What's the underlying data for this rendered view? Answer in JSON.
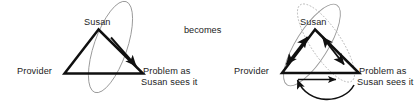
{
  "figure": {
    "type": "diagram",
    "connector_label": "becomes",
    "panels": [
      {
        "id": "before",
        "nodes": [
          {
            "id": "susan",
            "label": "Susan"
          },
          {
            "id": "provider",
            "label": "Provider"
          },
          {
            "id": "problem",
            "label_line1": "Problem as",
            "label_line2": "Susan sees it"
          }
        ],
        "arrows": [
          {
            "from": "susan",
            "to": "problem",
            "style": "straight",
            "heads": "single"
          }
        ],
        "ellipses": [
          {
            "id": "susan-problem-ellipse",
            "style": "solid",
            "color": "#9a9a9a",
            "encloses": [
              "susan",
              "problem"
            ]
          }
        ]
      },
      {
        "id": "after",
        "nodes": [
          {
            "id": "susan",
            "label": "Susan"
          },
          {
            "id": "provider",
            "label": "Provider"
          },
          {
            "id": "problem",
            "label_line1": "Problem as",
            "label_line2": "Susan sees it"
          }
        ],
        "arrows": [
          {
            "from": "provider",
            "to": "susan",
            "style": "straight",
            "heads": "double"
          },
          {
            "from": "susan",
            "to": "problem",
            "style": "straight",
            "heads": "double"
          },
          {
            "from": "provider",
            "to": "problem",
            "style": "straight",
            "heads": "single"
          },
          {
            "from": "problem",
            "to": "provider",
            "style": "curved",
            "heads": "single"
          }
        ],
        "ellipses": [
          {
            "id": "susan-provider-ellipse",
            "style": "solid",
            "color": "#9a9a9a",
            "encloses": [
              "susan",
              "provider"
            ]
          },
          {
            "id": "susan-problem-ellipse",
            "style": "dotted",
            "color": "#b4b4b4",
            "encloses": [
              "susan",
              "problem"
            ]
          }
        ]
      }
    ],
    "colors": {
      "triangle_stroke": "#101010",
      "arrow_stroke": "#101010",
      "ellipse_solid": "#9a9a9a",
      "ellipse_dotted": "#b4b4b4",
      "text": "#1d1d1d",
      "background": "#ffffff"
    }
  }
}
